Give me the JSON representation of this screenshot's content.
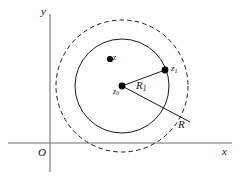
{
  "figure": {
    "background_color": "#ffffff",
    "axes": {
      "x_axis_label": "x",
      "y_axis_label": "y",
      "origin_label": "O",
      "axis_color": "#6f6f6f"
    },
    "labels": {
      "point_z": "z",
      "center_z0": "z",
      "center_z0_sub": "0",
      "point_z1": "z",
      "point_z1_sub": "1",
      "radius_inner": "R",
      "radius_inner_sub": "1",
      "radius_outer": "R"
    },
    "geometry": {
      "center_x": 122,
      "center_y": 86,
      "inner_radius": 47,
      "outer_radius": 66,
      "inner_circle_style": "solid",
      "outer_circle_style": "dashed",
      "stroke_color": "#1a1a1a",
      "point_color": "#000000",
      "point_z_x": 110,
      "point_z_y": 60,
      "point_z1_x": 165,
      "point_z1_y": 70,
      "radius_outer_end_x": 190,
      "radius_outer_end_y": 122,
      "x_axis_y": 143,
      "y_axis_x": 50
    }
  }
}
